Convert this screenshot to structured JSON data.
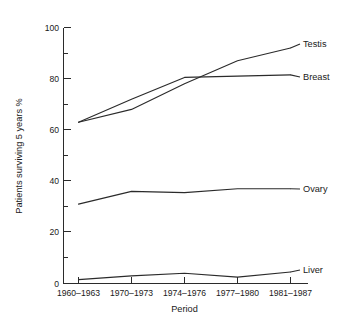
{
  "chart_data": {
    "type": "line",
    "title": "",
    "xlabel": "Period",
    "ylabel": "Patients surviving 5 years %",
    "categories": [
      "1960–1963",
      "1970–1973",
      "1974–1976",
      "1977–1980",
      "1981–1987"
    ],
    "ylim": [
      0,
      100
    ],
    "yticks": [
      0,
      20,
      40,
      60,
      80,
      100
    ],
    "yticks_minor": [
      10,
      30,
      50,
      70,
      90
    ],
    "ytick_labels": [
      "0",
      "20",
      "40",
      "60",
      "80",
      "100"
    ],
    "grid": false,
    "legend_position": "right-inline-labels",
    "series": [
      {
        "name": "Testis",
        "values": [
          63,
          68,
          78,
          87,
          92
        ]
      },
      {
        "name": "Breast",
        "values": [
          63,
          72,
          80.5,
          81,
          81.5
        ]
      },
      {
        "name": "Ovary",
        "values": [
          31,
          36,
          35.5,
          37,
          37
        ]
      },
      {
        "name": "Liver",
        "values": [
          1.5,
          3,
          4,
          2.5,
          4.5
        ]
      }
    ]
  },
  "axes": {
    "y_title": "Patients surviving 5 years %",
    "x_title": "Period",
    "y_tick_labels": [
      "100",
      "80",
      "60",
      "40",
      "20",
      "0"
    ],
    "x_tick_labels": [
      "1960–1963",
      "1970–1973",
      "1974–1976",
      "1977–1980",
      "1981–1987"
    ]
  },
  "series_labels": {
    "testis": "Testis",
    "breast": "Breast",
    "ovary": "Ovary",
    "liver": "Liver"
  },
  "colors": {
    "ink": "#2b2b2b",
    "background": "#ffffff"
  }
}
